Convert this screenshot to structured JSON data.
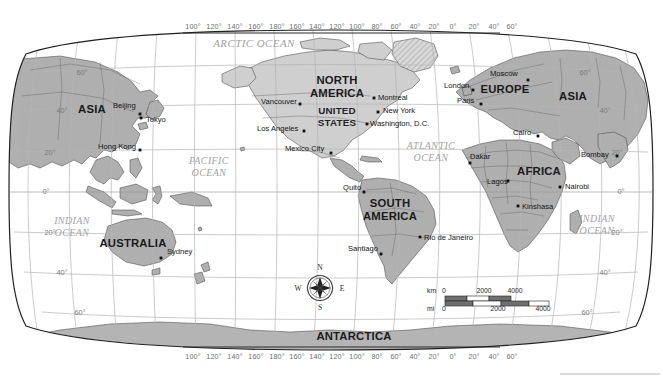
{
  "map": {
    "title": "World Map",
    "projection": "robinson-pacific-centered",
    "colors": {
      "land": "#b0b0b0",
      "land_light": "#cfcfcf",
      "antarctica": "#b4b4b4",
      "ocean": "#ffffff",
      "graticule": "#b5b5b5",
      "border": "#2a2a2a",
      "label_dark": "#141414",
      "label_ocean": "#a2a2a2",
      "graticule_label": "#6d6d6d"
    },
    "longitude_labels": [
      "100°",
      "120°",
      "140°",
      "160°",
      "180°",
      "160°",
      "140°",
      "120°",
      "100°",
      "80°",
      "60°",
      "40°",
      "20°",
      "0°",
      "20°",
      "40°",
      "60°"
    ],
    "latitude_labels_left": [
      "60°",
      "40°",
      "20°",
      "0°",
      "20°",
      "40°",
      "60°"
    ],
    "latitude_labels_right": [
      "60°",
      "40°",
      "20°",
      "0°",
      "20°",
      "40°",
      "60°"
    ],
    "continents": [
      {
        "name": "ASIA",
        "x": 92,
        "y": 113
      },
      {
        "name": "NORTH AMERICA",
        "line1": "NORTH",
        "line2": "AMERICA",
        "x": 337,
        "y": 84
      },
      {
        "name": "EUROPE",
        "x": 505,
        "y": 93
      },
      {
        "name": "ASIA",
        "x": 573,
        "y": 100
      },
      {
        "name": "AFRICA",
        "x": 539,
        "y": 175
      },
      {
        "name": "SOUTH AMERICA",
        "line1": "SOUTH",
        "line2": "AMERICA",
        "x": 390,
        "y": 207
      },
      {
        "name": "AUSTRALIA",
        "x": 133,
        "y": 247
      },
      {
        "name": "ANTARCTICA",
        "x": 354,
        "y": 340
      }
    ],
    "countries": [
      {
        "name": "UNITED STATES",
        "line1": "UNITED",
        "line2": "STATES",
        "x": 337,
        "y": 114
      }
    ],
    "oceans": [
      {
        "name": "ARCTIC OCEAN",
        "lines": [
          "ARCTIC OCEAN"
        ],
        "x": 254,
        "y": 47
      },
      {
        "name": "PACIFIC OCEAN",
        "lines": [
          "PACIFIC",
          "OCEAN"
        ],
        "x": 209,
        "y": 164
      },
      {
        "name": "ATLANTIC OCEAN",
        "lines": [
          "ATLANTIC",
          "OCEAN"
        ],
        "x": 431,
        "y": 149
      },
      {
        "name": "INDIAN OCEAN",
        "lines": [
          "INDIAN",
          "OCEAN"
        ],
        "x": 72,
        "y": 224
      },
      {
        "name": "INDIAN OCEAN",
        "lines": [
          "INDIAN",
          "OCEAN"
        ],
        "x": 597,
        "y": 222
      }
    ],
    "cities": [
      {
        "name": "Beijing",
        "lx": 113,
        "ly": 108,
        "dx": 140,
        "dy": 114,
        "anchor": "start"
      },
      {
        "name": "Tokyo",
        "lx": 146,
        "ly": 122,
        "dx": 141,
        "dy": 118,
        "anchor": "start"
      },
      {
        "name": "Hong Kong",
        "lx": 98,
        "ly": 149,
        "dx": 140,
        "dy": 150,
        "anchor": "start"
      },
      {
        "name": "Sydney",
        "lx": 167,
        "ly": 254,
        "dx": 161,
        "dy": 258,
        "anchor": "start"
      },
      {
        "name": "Vancouver",
        "lx": 261,
        "ly": 104,
        "dx": 300,
        "dy": 104,
        "anchor": "start"
      },
      {
        "name": "Los Angeles",
        "lx": 257,
        "ly": 131,
        "dx": 304,
        "dy": 131,
        "anchor": "start"
      },
      {
        "name": "Mexico City",
        "lx": 285,
        "ly": 151,
        "dx": 331,
        "dy": 153,
        "anchor": "start"
      },
      {
        "name": "Montreal",
        "lx": 378,
        "ly": 100,
        "dx": 374,
        "dy": 98,
        "anchor": "start"
      },
      {
        "name": "New York",
        "lx": 383,
        "ly": 113,
        "dx": 378,
        "dy": 112,
        "anchor": "start"
      },
      {
        "name": "Washington, D.C.",
        "lx": 370,
        "ly": 126,
        "dx": 367,
        "dy": 124,
        "anchor": "start"
      },
      {
        "name": "Quito",
        "lx": 343,
        "ly": 190,
        "dx": 364,
        "dy": 192,
        "anchor": "start"
      },
      {
        "name": "Rio de Janeiro",
        "lx": 424,
        "ly": 240,
        "dx": 420,
        "dy": 237,
        "anchor": "start"
      },
      {
        "name": "Santiago",
        "lx": 348,
        "ly": 251,
        "dx": 381,
        "dy": 254,
        "anchor": "start"
      },
      {
        "name": "London",
        "lx": 444,
        "ly": 88,
        "dx": 473,
        "dy": 90,
        "anchor": "start"
      },
      {
        "name": "Paris",
        "lx": 457,
        "ly": 103,
        "dx": 481,
        "dy": 104,
        "anchor": "start"
      },
      {
        "name": "Moscow",
        "lx": 490,
        "ly": 76,
        "dx": 528,
        "dy": 80,
        "anchor": "start"
      },
      {
        "name": "Cairo",
        "lx": 513,
        "ly": 135,
        "dx": 538,
        "dy": 136,
        "anchor": "start"
      },
      {
        "name": "Dakar",
        "lx": 470,
        "ly": 159,
        "dx": 470,
        "dy": 163,
        "anchor": "start"
      },
      {
        "name": "Lagos",
        "lx": 487,
        "ly": 184,
        "dx": 508,
        "dy": 181,
        "anchor": "start"
      },
      {
        "name": "Nairobi",
        "lx": 565,
        "ly": 189,
        "dx": 560,
        "dy": 187,
        "anchor": "start"
      },
      {
        "name": "Kinshasa",
        "lx": 522,
        "ly": 209,
        "dx": 518,
        "dy": 206,
        "anchor": "start"
      },
      {
        "name": "Bombay",
        "lx": 581,
        "ly": 157,
        "dx": 617,
        "dy": 156,
        "anchor": "start"
      }
    ],
    "compass": {
      "name": "compass-rose",
      "cx": 320,
      "cy": 287,
      "north": "N",
      "south": "S",
      "east": "E",
      "west": "W"
    },
    "scale_bar": {
      "km_unit": "km",
      "mi_unit": "mi",
      "km_ticks": [
        "0",
        "2000",
        "4000"
      ],
      "mi_ticks": [
        "0",
        "2000",
        "4000"
      ]
    }
  }
}
